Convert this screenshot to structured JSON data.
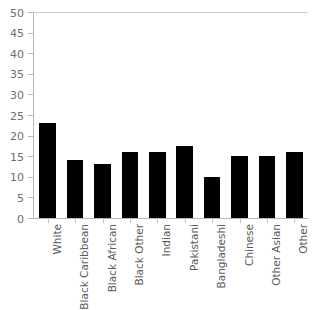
{
  "chart_data": {
    "type": "bar",
    "title": "",
    "subtitle": "",
    "xlabel": "",
    "ylabel": "",
    "ylim": [
      0,
      50
    ],
    "yticks": [
      0,
      5,
      10,
      15,
      20,
      25,
      30,
      35,
      40,
      45,
      50
    ],
    "grid": false,
    "legend": null,
    "bar_color": "#000000",
    "axis_color": "#b9b9b9",
    "tick_label_color": "#6e6e6e",
    "category_label_color": "#5a5a5a",
    "categories": [
      "White",
      "Black Caribbean",
      "Black African",
      "Black Other",
      "Indian",
      "Pakistani",
      "Bangladeshi",
      "Chinese",
      "Other Asian",
      "Other"
    ],
    "values": [
      23,
      14,
      13,
      16,
      16,
      17.5,
      10,
      15,
      15,
      16
    ]
  }
}
